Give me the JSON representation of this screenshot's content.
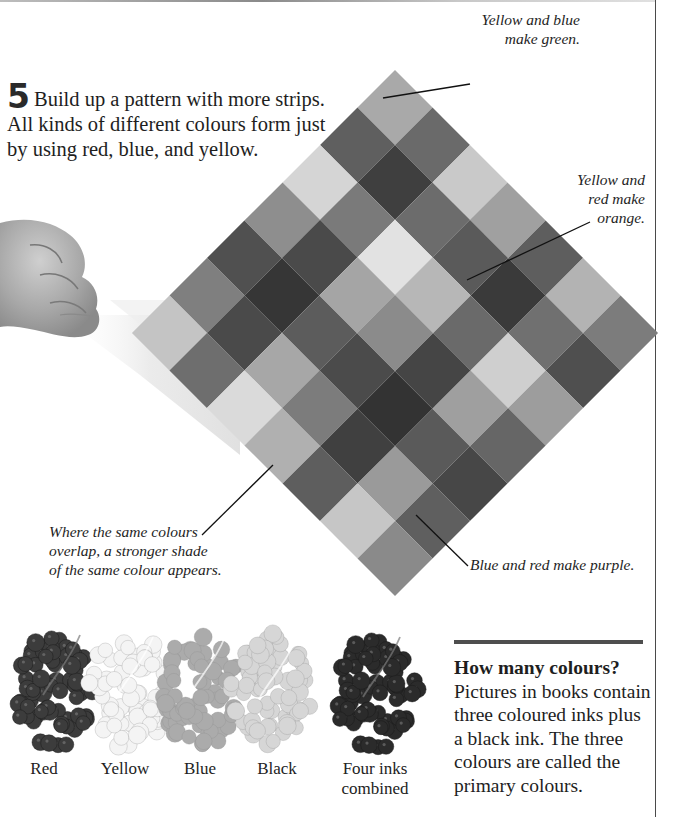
{
  "page": {
    "step_number": "5",
    "step_text": "Build up a pattern with more strips. All kinds of different colours form just by using red, blue, and yellow."
  },
  "callouts": {
    "green": {
      "line1": "Yellow and blue",
      "line2": "make green."
    },
    "orange": {
      "line1": "Yellow and",
      "line2": "red make",
      "line3": "orange."
    },
    "same": {
      "line1": "Where the same colours",
      "line2": "overlap, a stronger shade",
      "line3": "of the same colour appears."
    },
    "purple": {
      "text": "Blue and red make purple."
    }
  },
  "diamond_grid": {
    "rows": 7,
    "cols": 7,
    "cells": [
      [
        "#a9a9a9",
        "#6a6a6a",
        "#c9c9c9",
        "#a0a0a0",
        "#5e5e5e",
        "#b3b3b3",
        "#7c7c7c"
      ],
      [
        "#5f5f5f",
        "#3f3f3f",
        "#6c6c6c",
        "#5a5a5a",
        "#3a3a3a",
        "#707070",
        "#4f4f4f"
      ],
      [
        "#d5d5d5",
        "#7a7a7a",
        "#e2e2e2",
        "#b7b7b7",
        "#6a6a6a",
        "#cfcfcf",
        "#9d9d9d"
      ],
      [
        "#8e8e8e",
        "#4a4a4a",
        "#a5a5a5",
        "#8b8b8b",
        "#454545",
        "#9f9f9f",
        "#666666"
      ],
      [
        "#505050",
        "#363636",
        "#5c5c5c",
        "#4b4b4b",
        "#333333",
        "#5a5a5a",
        "#474747"
      ],
      [
        "#7f7f7f",
        "#4a4a4a",
        "#a7a7a7",
        "#7c7c7c",
        "#404040",
        "#9a9a9a",
        "#5f5f5f"
      ],
      [
        "#c4c4c4",
        "#6e6e6e",
        "#dadada",
        "#b0b0b0",
        "#5e5e5e",
        "#c6c6c6",
        "#8a8a8a"
      ]
    ]
  },
  "grapes": [
    {
      "label": "Red",
      "tone": "#3c3c3c"
    },
    {
      "label": "Yellow",
      "tone": "#f4f4f4"
    },
    {
      "label": "Blue",
      "tone": "#ababab"
    },
    {
      "label": "Black",
      "tone": "#d6d6d6"
    },
    {
      "label_line1": "Four inks",
      "label_line2": "combined",
      "tone": "#2b2b2b"
    }
  ],
  "info_box": {
    "title": "How many colours?",
    "body": "Pictures in books contain three coloured inks plus a black ink. The three colours are called the primary colours."
  }
}
